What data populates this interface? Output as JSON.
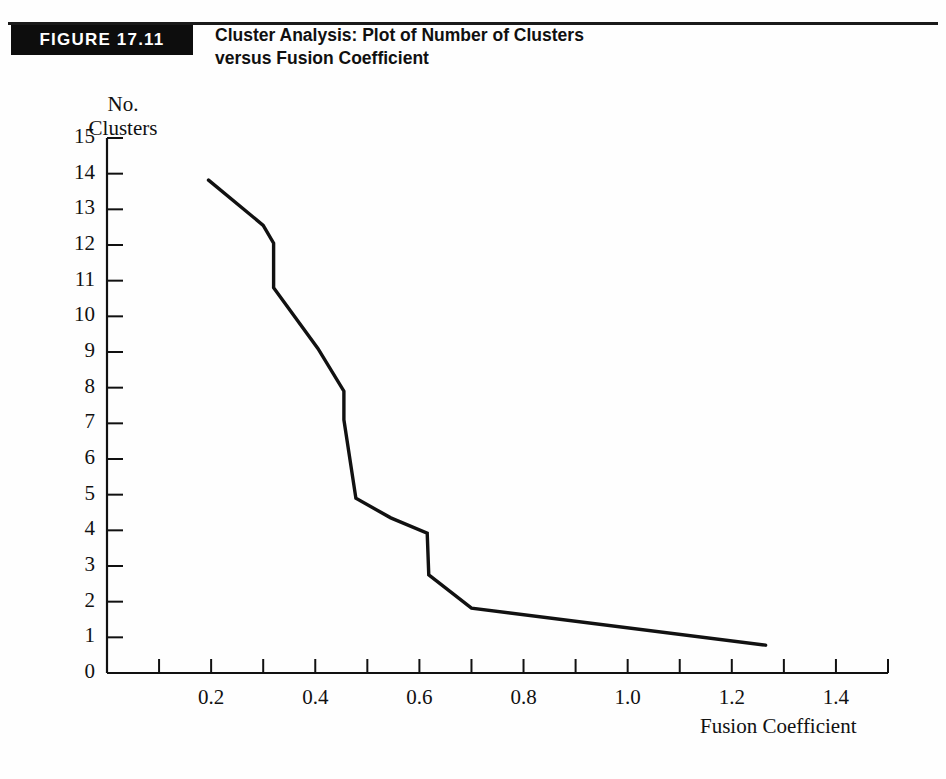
{
  "figure": {
    "badge": "FIGURE 17.11",
    "title_line1": "Cluster Analysis: Plot of Number of Clusters",
    "title_line2": "versus Fusion Coefficient",
    "accent_color": "#0d0d0d",
    "line_color": "#111111",
    "background": "#fefefe"
  },
  "chart_data": {
    "type": "line",
    "title": "Cluster Analysis: Plot of Number of Clusters versus Fusion Coefficient",
    "xlabel": "Fusion Coefficient",
    "ylabel": "No. Clusters",
    "ylabel_line1": "No.",
    "ylabel_line2": "Clusters",
    "xlim": [
      0.0,
      1.5
    ],
    "ylim": [
      0,
      15
    ],
    "grid": false,
    "legend": "none",
    "x_major_ticks": [
      0.2,
      0.4,
      0.6,
      0.8,
      1.0,
      1.2,
      1.4
    ],
    "x_minor_ticks": [
      0.1,
      0.3,
      0.5,
      0.7,
      0.9,
      1.1,
      1.3,
      1.5
    ],
    "x_tick_labels": [
      "0.2",
      "0.4",
      "0.6",
      "0.8",
      "1.0",
      "1.2",
      "1.4"
    ],
    "y_ticks": [
      0,
      1,
      2,
      3,
      4,
      5,
      6,
      7,
      8,
      9,
      10,
      11,
      12,
      13,
      14,
      15
    ],
    "y_tick_labels": [
      "0",
      "1",
      "2",
      "3",
      "4",
      "5",
      "6",
      "7",
      "8",
      "9",
      "10",
      "11",
      "12",
      "13",
      "14",
      "15"
    ],
    "series": [
      {
        "name": "Fusion coefficient curve",
        "x": [
          0.195,
          0.3,
          0.32,
          0.32,
          0.405,
          0.455,
          0.455,
          0.478,
          0.545,
          0.615,
          0.618,
          0.7,
          1.265
        ],
        "y": [
          13.82,
          12.55,
          12.05,
          10.8,
          9.1,
          7.9,
          7.1,
          4.9,
          4.35,
          3.92,
          2.75,
          1.82,
          0.78
        ]
      }
    ]
  }
}
